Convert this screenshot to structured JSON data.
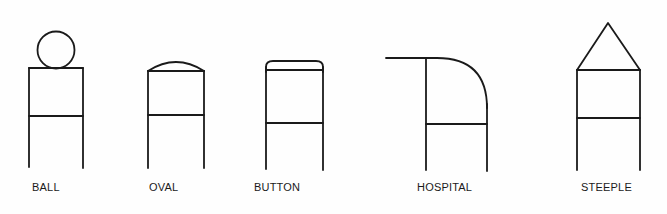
{
  "diagram": {
    "title": "",
    "ink_color": "#1a1a1a",
    "background": "#fefefe",
    "items": [
      {
        "id": "ball",
        "label": "BALL",
        "top_shape": "circle"
      },
      {
        "id": "oval",
        "label": "OVAL",
        "top_shape": "shallow-arc"
      },
      {
        "id": "button",
        "label": "BUTTON",
        "top_shape": "rounded-cap"
      },
      {
        "id": "hospital",
        "label": "HOSPITAL",
        "top_shape": "quarter-round-with-extension"
      },
      {
        "id": "steeple",
        "label": "STEEPLE",
        "top_shape": "triangle"
      }
    ]
  }
}
